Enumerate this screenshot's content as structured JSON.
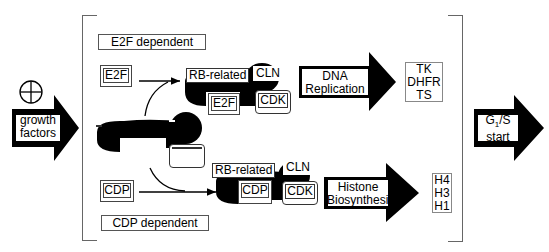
{
  "input": {
    "symbol": "⊕",
    "arrow_label_lines": [
      "growth",
      "factors"
    ]
  },
  "sections": {
    "e2f": {
      "title": "E2F dependent",
      "free_factor": "E2F",
      "complex": {
        "pocket": "RB-related",
        "cyclin": "CLN",
        "kinase": "CDK",
        "bound": "E2F"
      },
      "process_lines": [
        "DNA",
        "Replication"
      ],
      "targets": [
        "TK",
        "DHFR",
        "TS"
      ]
    },
    "central_complex": {
      "pocket": "RB-related",
      "cyclin": "CLN",
      "kinase": "CDK"
    },
    "cdp": {
      "title": "CDP dependent",
      "free_factor": "CDP",
      "complex": {
        "pocket": "RB-related",
        "cyclin": "CLN",
        "kinase": "CDK",
        "bound": "CDP"
      },
      "process_lines": [
        "Histone",
        "Biosynthesis"
      ],
      "targets": [
        "H4",
        "H3",
        "H1"
      ]
    }
  },
  "output": {
    "arrow_label_main": "G",
    "arrow_label_sub": "1",
    "arrow_label_rest": "/S",
    "arrow_label_line2": "start"
  }
}
